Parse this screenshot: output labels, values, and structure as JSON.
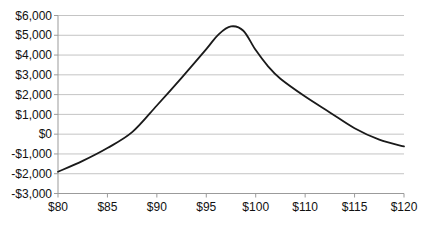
{
  "chart_data": {
    "type": "line",
    "title": "",
    "xlabel": "",
    "ylabel": "",
    "legend": "none",
    "grid": "horizontal",
    "x_tick_labels": [
      "$80",
      "$85",
      "$90",
      "$95",
      "$100",
      "$110",
      "$115",
      "$120"
    ],
    "y_tick_labels": [
      "$6,000",
      "$5,000",
      "$4,000",
      "$3,000",
      "$2,000",
      "$1,000",
      "$0",
      "-$1,000",
      "-$2,000",
      "-$3,000"
    ],
    "ylim": [
      -3000,
      6000
    ],
    "y_gridline_step": 1000,
    "series": [
      {
        "name": "profit-curve",
        "x_unit": "tick-index (0 = '$80' tick, 7 = '$120' tick, ticks evenly spaced as labeled)",
        "points": [
          [
            0,
            -1900
          ],
          [
            0.5,
            -1350
          ],
          [
            1,
            -700
          ],
          [
            1.5,
            100
          ],
          [
            2,
            1450
          ],
          [
            2.5,
            2850
          ],
          [
            3,
            4300
          ],
          [
            3.25,
            5050
          ],
          [
            3.5,
            5450
          ],
          [
            3.75,
            5230
          ],
          [
            4,
            4250
          ],
          [
            4.25,
            3430
          ],
          [
            4.5,
            2800
          ],
          [
            5,
            1900
          ],
          [
            5.5,
            1100
          ],
          [
            6,
            300
          ],
          [
            6.5,
            -280
          ],
          [
            7,
            -620
          ]
        ],
        "peak": {
          "approx_x": "between $95 and $100 ticks",
          "value": 5450
        }
      }
    ],
    "values_at_x_ticks": {
      "$80": -1900,
      "$85": -700,
      "$90": 1450,
      "$95": 4300,
      "$100": 4250,
      "$110": 1900,
      "$115": 300,
      "$120": -620
    },
    "colors": {
      "line": "#1a1a1a",
      "gridline": "#c4c4c4",
      "axis": "#9b9b9b",
      "label": "#111111",
      "background": "#ffffff"
    }
  }
}
